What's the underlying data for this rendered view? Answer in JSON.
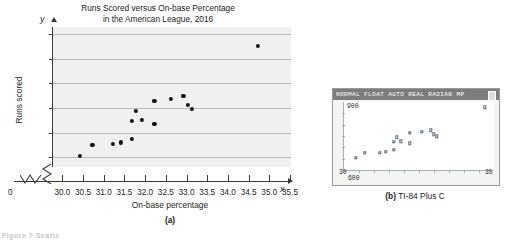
{
  "figure": {
    "panel_a_caption": "(a)",
    "panel_b_caption_prefix": "(b)",
    "panel_b_caption_text": "TI-84 Plus C",
    "bottom_note": "Figure 7 Scatte"
  },
  "calculator": {
    "status_bar": "NORMAL FLOAT AUTO REAL RADIAN MP",
    "y_max_label": "900",
    "y_min_label": "600",
    "x_min_label": "30",
    "x_max_label": "35",
    "battery_icon": "battery-icon"
  },
  "chart_data": {
    "type": "scatter",
    "title": "Runs Scored versus On-base Percentage in the American League, 2016",
    "title_line1": "Runs Scored versus On-base Percentage",
    "title_line2": "in the American League, 2016",
    "xlabel": "On-base percentage",
    "ylabel": "Runs scored",
    "x_axis_letter": "x",
    "y_axis_letter": "y",
    "origin_label": "0",
    "xlim": [
      29.75,
      35.5
    ],
    "ylim": [
      630,
      915
    ],
    "grid": true,
    "axis_break": true,
    "xticks": [
      30.0,
      30.5,
      31.0,
      31.5,
      32.0,
      32.5,
      33.0,
      33.5,
      34.0,
      34.5,
      35.0,
      35.5
    ],
    "xticklabels": [
      "30.0",
      "30.5",
      "31.0",
      "31.5",
      "32.0",
      "32.5",
      "33.0",
      "33.5",
      "34.0",
      "34.5",
      "35.0",
      "35.5"
    ],
    "yticks": [
      650,
      700,
      750,
      800,
      850,
      900
    ],
    "yticklabels": [
      "650",
      "700",
      "750",
      "800",
      "850",
      "900"
    ],
    "points": [
      {
        "x": 30.4,
        "y": 653
      },
      {
        "x": 30.7,
        "y": 675
      },
      {
        "x": 31.2,
        "y": 677
      },
      {
        "x": 31.4,
        "y": 680
      },
      {
        "x": 31.65,
        "y": 688
      },
      {
        "x": 31.65,
        "y": 724
      },
      {
        "x": 31.75,
        "y": 745
      },
      {
        "x": 31.9,
        "y": 726
      },
      {
        "x": 32.2,
        "y": 718
      },
      {
        "x": 32.2,
        "y": 765
      },
      {
        "x": 32.6,
        "y": 768
      },
      {
        "x": 32.9,
        "y": 775
      },
      {
        "x": 33.0,
        "y": 757
      },
      {
        "x": 33.1,
        "y": 749
      },
      {
        "x": 34.7,
        "y": 877
      }
    ],
    "calculator_points": [
      {
        "x": 30.4,
        "y": 653
      },
      {
        "x": 30.7,
        "y": 675
      },
      {
        "x": 31.2,
        "y": 677
      },
      {
        "x": 31.4,
        "y": 680
      },
      {
        "x": 31.65,
        "y": 688
      },
      {
        "x": 31.65,
        "y": 724
      },
      {
        "x": 31.75,
        "y": 745
      },
      {
        "x": 31.9,
        "y": 726
      },
      {
        "x": 32.2,
        "y": 718
      },
      {
        "x": 32.2,
        "y": 765
      },
      {
        "x": 32.6,
        "y": 768
      },
      {
        "x": 32.9,
        "y": 775
      },
      {
        "x": 33.0,
        "y": 757
      },
      {
        "x": 33.1,
        "y": 749
      },
      {
        "x": 34.7,
        "y": 877
      }
    ]
  }
}
